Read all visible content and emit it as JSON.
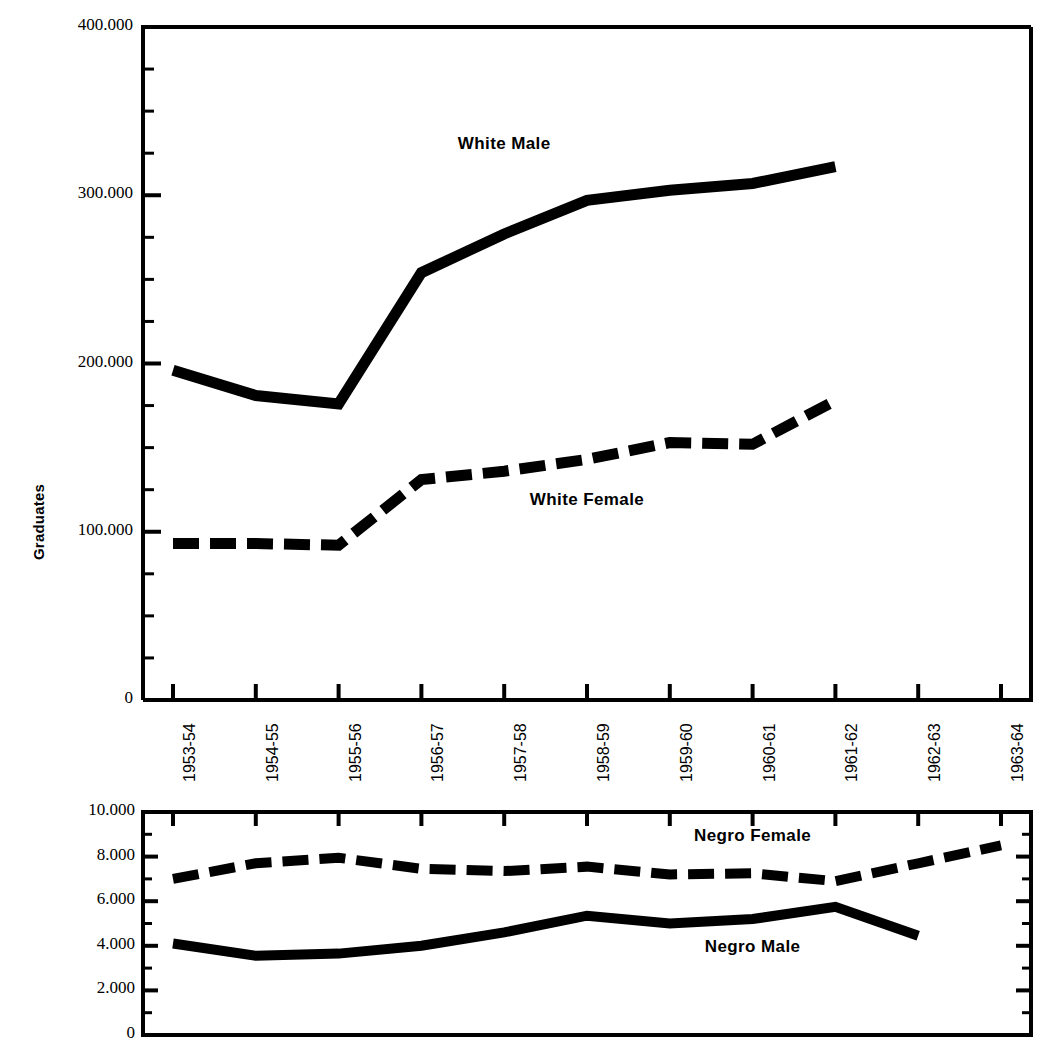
{
  "figure": {
    "y_axis_title": "Graduates",
    "ink_color": "#000000",
    "background_color": "#ffffff"
  },
  "chart_data": [
    {
      "type": "line",
      "title": "",
      "subtitle": "",
      "xlabel": "",
      "ylabel": "Graduates",
      "panel": "upper",
      "x": [
        "1953-54",
        "1954-55",
        "1955-56",
        "1956-57",
        "1957-58",
        "1958-59",
        "1959-60",
        "1960-61",
        "1961-62",
        "1962-63",
        "1963-64"
      ],
      "categories": [
        "1953-54",
        "1954-55",
        "1955-56",
        "1956-57",
        "1957-58",
        "1958-59",
        "1959-60",
        "1960-61",
        "1961-62",
        "1962-63",
        "1963-64"
      ],
      "ylim": [
        0,
        400000
      ],
      "ytick_labels": [
        "0",
        "100,000",
        "200,000",
        "300,000",
        "400,000"
      ],
      "ytick_values": [
        0,
        100000,
        200000,
        300000,
        400000
      ],
      "minor_tick_interval": 25000,
      "grid": false,
      "legend": "inline-annotations",
      "series": [
        {
          "name": "White Male",
          "style": "solid",
          "values": [
            196000,
            181000,
            176000,
            254000,
            277000,
            297000,
            303000,
            307000,
            317000,
            null,
            null
          ]
        },
        {
          "name": "White Female",
          "style": "dashed",
          "values": [
            93000,
            93000,
            92000,
            131000,
            136000,
            143000,
            153000,
            152000,
            178000,
            null,
            null
          ]
        }
      ],
      "annotations": [
        {
          "text": "White Male",
          "x": "1957-58",
          "y": 330000
        },
        {
          "text": "White  Female",
          "x": "1958-59",
          "y": 118000
        }
      ]
    },
    {
      "type": "line",
      "title": "",
      "subtitle": "",
      "xlabel": "",
      "ylabel": "",
      "panel": "lower",
      "x": [
        "1953-54",
        "1954-55",
        "1955-56",
        "1956-57",
        "1957-58",
        "1958-59",
        "1959-60",
        "1960-61",
        "1961-62",
        "1962-63",
        "1963-64"
      ],
      "categories": [
        "1953-54",
        "1954-55",
        "1955-56",
        "1956-57",
        "1957-58",
        "1958-59",
        "1959-60",
        "1960-61",
        "1961-62",
        "1962-63",
        "1963-64"
      ],
      "ylim": [
        0,
        10000
      ],
      "ytick_labels": [
        "0",
        "2,000",
        "4,000",
        "6,000",
        "8,000",
        "10,000"
      ],
      "ytick_values": [
        0,
        2000,
        4000,
        6000,
        8000,
        10000
      ],
      "minor_tick_interval": 1000,
      "grid": false,
      "legend": "inline-annotations",
      "series": [
        {
          "name": "Negro Female",
          "style": "dashed",
          "values": [
            7000,
            7700,
            7950,
            7450,
            7350,
            7550,
            7200,
            7250,
            6900,
            7700,
            8500
          ]
        },
        {
          "name": "Negro Male",
          "style": "solid",
          "values": [
            4100,
            3550,
            3650,
            4000,
            4600,
            5350,
            5000,
            5200,
            5750,
            4450,
            null
          ]
        }
      ],
      "annotations": [
        {
          "text": "Negro Female",
          "x": "1960-61",
          "y": 8900
        },
        {
          "text": "Negro Male",
          "x": "1960-61",
          "y": 3900
        }
      ]
    }
  ]
}
